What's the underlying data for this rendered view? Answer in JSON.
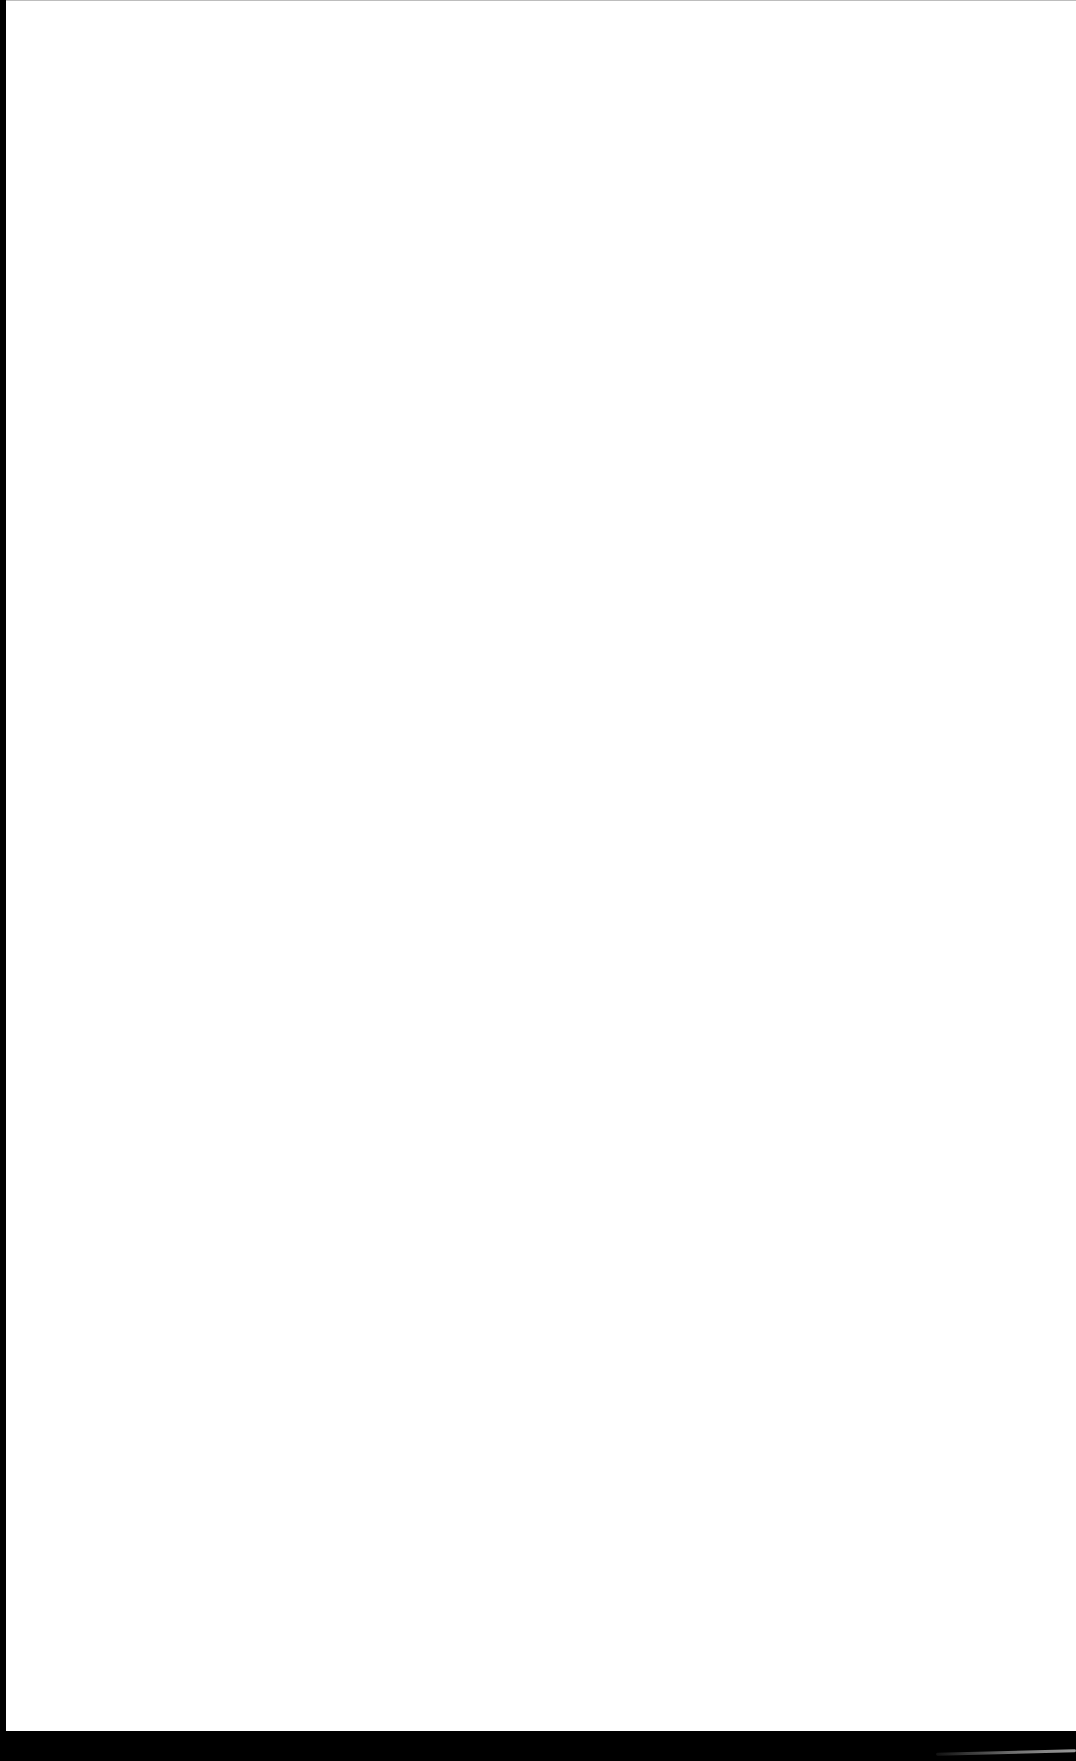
{
  "screen": {
    "state": "blank",
    "background_color": "#ffffff",
    "frame_color": "#000000"
  }
}
